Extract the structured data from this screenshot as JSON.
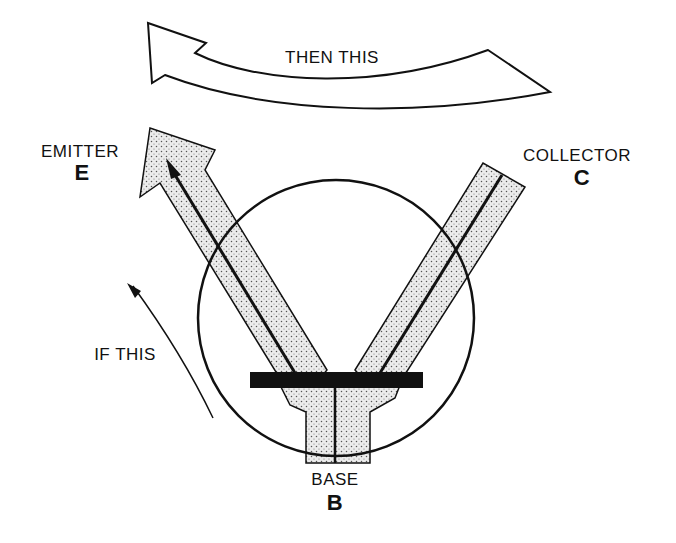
{
  "diagram": {
    "type": "transistor-action-illustration",
    "labels": {
      "top_arrow": "THEN THIS",
      "side_arrow": "IF THIS",
      "emitter_name": "EMITTER",
      "emitter_letter": "E",
      "collector_name": "COLLECTOR",
      "collector_letter": "C",
      "base_name": "BASE",
      "base_letter": "B"
    },
    "colors": {
      "ink": "#111111",
      "background": "#ffffff",
      "stipple_fill": "#e6e6e6",
      "stipple_dot": "#555555"
    }
  }
}
